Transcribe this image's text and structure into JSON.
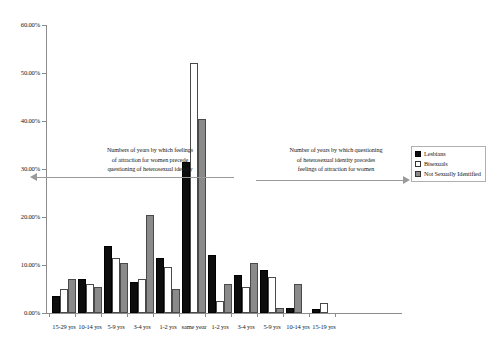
{
  "chart_data": {
    "type": "bar",
    "title": "",
    "xlabel": "",
    "ylabel": "",
    "ylim": [
      0,
      60
    ],
    "grid": false,
    "legend_position": "right",
    "y_ticks": [
      "0.00%",
      "10.00%",
      "20.00%",
      "30.00%",
      "40.00%",
      "50.00%",
      "60.00%"
    ],
    "y_tick_values": [
      0,
      10,
      20,
      30,
      40,
      50,
      60
    ],
    "categories": [
      "15-29 yrs",
      "10-14 yrs",
      "5-9 yrs",
      "3-4 yrs",
      "1-2 yrs",
      "same year",
      "1-2 yrs",
      "3-4 yrs",
      "5-9 yrs",
      "10-14 yrs",
      "15-19 yrs"
    ],
    "series": [
      {
        "name": "Lesbians",
        "color": "#0d0d0d",
        "values": [
          3.5,
          7.0,
          14.0,
          6.5,
          11.5,
          31.5,
          12.0,
          8.0,
          9.0,
          1.0,
          0.8
        ]
      },
      {
        "name": "Bisexuals",
        "color": "#ffffff",
        "values": [
          5.0,
          6.0,
          11.5,
          7.0,
          9.5,
          52.0,
          2.5,
          5.5,
          7.5,
          0.0,
          2.0
        ]
      },
      {
        "name": "Not Sexually Identified",
        "color": "#8a8a8a",
        "values": [
          7.0,
          5.5,
          10.5,
          20.5,
          5.0,
          40.5,
          6.0,
          10.5,
          1.0,
          6.0,
          0.0
        ]
      }
    ],
    "annotations": [
      {
        "id": "left-annotation",
        "direction": "left",
        "lines": [
          "Numbers of years by which feelings",
          "of attraction for women precede",
          "questioning of heterosexual identity"
        ]
      },
      {
        "id": "right-annotation",
        "direction": "right",
        "lines": [
          "Number of years by which questioning",
          "of heterosexual identity precedes",
          "feelings of attraction for women"
        ]
      }
    ]
  }
}
